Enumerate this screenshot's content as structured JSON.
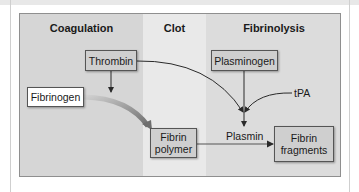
{
  "columns": [
    {
      "title": "Coagulation"
    },
    {
      "title": "Clot"
    },
    {
      "title": "Fibrinolysis"
    }
  ],
  "nodes": {
    "thrombin": "Thrombin",
    "fibrinogen": "Fibrinogen",
    "fibrin_polymer_line1": "Fibrin",
    "fibrin_polymer_line2": "polymer",
    "plasminogen": "Plasminogen",
    "tpa": "tPA",
    "plasmin": "Plasmin",
    "fibrin_fragments_line1": "Fibrin",
    "fibrin_fragments_line2": "fragments"
  },
  "colors": {
    "coagulation_bg": "#d6d6d6",
    "clot_bg": "#e9e9e9",
    "fibrinolysis_bg": "#dcdcdc",
    "box_fill": "#cfcfcf",
    "arrow": "#2a2a2a",
    "gradient_arrow_start": "#d0d0d0",
    "gradient_arrow_end": "#6e6e6e"
  }
}
